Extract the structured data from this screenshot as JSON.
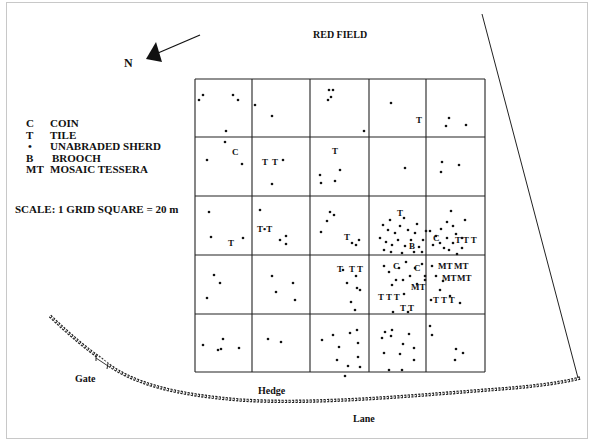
{
  "title": "RED FIELD",
  "north": {
    "label": "N"
  },
  "legend": [
    {
      "symbol": "C",
      "label": "COIN"
    },
    {
      "symbol": "•",
      "label": "TILE",
      "symbol_override": "T"
    },
    {
      "symbol": "•",
      "label": "UNABRADED SHERD"
    },
    {
      "symbol": "B",
      "label": "BROOCH"
    },
    {
      "symbol": "MT",
      "label": "MOSAIC TESSERA"
    }
  ],
  "scale": "SCALE:  1 GRID SQUARE = 20 m",
  "labels": {
    "gate": "Gate",
    "hedge": "Hedge",
    "lane": "Lane"
  },
  "grid": {
    "origin": [
      195,
      79
    ],
    "cols": [
      195,
      252,
      310,
      369,
      426,
      485
    ],
    "rows": [
      79,
      137,
      196,
      255,
      314,
      372
    ]
  },
  "sherds": [
    [
      199,
      100
    ],
    [
      203,
      95
    ],
    [
      233,
      95
    ],
    [
      238,
      100
    ],
    [
      226,
      131
    ],
    [
      255,
      105
    ],
    [
      272,
      116
    ],
    [
      329,
      90
    ],
    [
      333,
      90
    ],
    [
      331,
      97
    ],
    [
      328,
      100
    ],
    [
      364,
      131
    ],
    [
      391,
      103
    ],
    [
      449,
      118
    ],
    [
      466,
      125
    ],
    [
      446,
      126
    ],
    [
      225,
      142
    ],
    [
      207,
      160
    ],
    [
      242,
      164
    ],
    [
      283,
      160
    ],
    [
      272,
      184
    ],
    [
      320,
      175
    ],
    [
      321,
      183
    ],
    [
      340,
      170
    ],
    [
      335,
      181
    ],
    [
      405,
      168
    ],
    [
      442,
      162
    ],
    [
      459,
      165
    ],
    [
      441,
      172
    ],
    [
      209,
      212
    ],
    [
      211,
      237
    ],
    [
      243,
      238
    ],
    [
      260,
      210
    ],
    [
      280,
      240
    ],
    [
      286,
      236
    ],
    [
      286,
      244
    ],
    [
      330,
      212
    ],
    [
      334,
      215
    ],
    [
      327,
      221
    ],
    [
      321,
      232
    ],
    [
      352,
      243
    ],
    [
      356,
      245
    ],
    [
      359,
      240
    ],
    [
      214,
      275
    ],
    [
      220,
      283
    ],
    [
      207,
      298
    ],
    [
      272,
      276
    ],
    [
      276,
      292
    ],
    [
      293,
      283
    ],
    [
      295,
      300
    ],
    [
      343,
      270
    ],
    [
      347,
      283
    ],
    [
      356,
      276
    ],
    [
      357,
      288
    ],
    [
      351,
      302
    ],
    [
      360,
      290
    ],
    [
      355,
      310
    ],
    [
      203,
      345
    ],
    [
      223,
      339
    ],
    [
      221,
      349
    ],
    [
      218,
      350
    ],
    [
      239,
      348
    ],
    [
      268,
      339
    ],
    [
      281,
      342
    ],
    [
      322,
      340
    ],
    [
      333,
      335
    ],
    [
      350,
      333
    ],
    [
      357,
      330
    ],
    [
      339,
      347
    ],
    [
      358,
      343
    ],
    [
      337,
      360
    ],
    [
      348,
      366
    ],
    [
      358,
      357
    ],
    [
      345,
      376
    ],
    [
      360,
      367
    ],
    [
      385,
      332
    ],
    [
      392,
      330
    ],
    [
      382,
      338
    ],
    [
      391,
      336
    ],
    [
      409,
      334
    ],
    [
      403,
      344
    ],
    [
      414,
      348
    ],
    [
      384,
      353
    ],
    [
      400,
      354
    ],
    [
      414,
      360
    ],
    [
      389,
      370
    ],
    [
      402,
      370
    ],
    [
      430,
      326
    ],
    [
      432,
      335
    ],
    [
      456,
      349
    ],
    [
      463,
      353
    ],
    [
      455,
      360
    ]
  ],
  "cluster_sherds": [
    [
      383,
      225
    ],
    [
      390,
      220
    ],
    [
      388,
      230
    ],
    [
      395,
      233
    ],
    [
      400,
      226
    ],
    [
      404,
      218
    ],
    [
      408,
      230
    ],
    [
      398,
      240
    ],
    [
      392,
      245
    ],
    [
      386,
      242
    ],
    [
      380,
      238
    ],
    [
      405,
      246
    ],
    [
      411,
      240
    ],
    [
      415,
      233
    ],
    [
      417,
      224
    ],
    [
      419,
      247
    ],
    [
      423,
      240
    ],
    [
      426,
      231
    ],
    [
      422,
      252
    ],
    [
      414,
      252
    ],
    [
      402,
      253
    ],
    [
      391,
      252
    ],
    [
      384,
      250
    ],
    [
      430,
      231
    ],
    [
      436,
      236
    ],
    [
      433,
      245
    ],
    [
      440,
      243
    ],
    [
      444,
      248
    ],
    [
      449,
      250
    ],
    [
      453,
      243
    ],
    [
      447,
      238
    ],
    [
      441,
      229
    ],
    [
      447,
      222
    ],
    [
      453,
      226
    ],
    [
      462,
      238
    ],
    [
      456,
      234
    ],
    [
      465,
      220
    ],
    [
      451,
      211
    ],
    [
      462,
      248
    ],
    [
      457,
      254
    ],
    [
      384,
      266
    ],
    [
      389,
      272
    ],
    [
      399,
      268
    ],
    [
      406,
      262
    ],
    [
      396,
      280
    ],
    [
      403,
      280
    ],
    [
      410,
      276
    ],
    [
      415,
      268
    ],
    [
      392,
      285
    ],
    [
      404,
      294
    ],
    [
      417,
      284
    ],
    [
      422,
      264
    ],
    [
      425,
      276
    ],
    [
      432,
      266
    ],
    [
      436,
      276
    ],
    [
      443,
      281
    ],
    [
      440,
      290
    ],
    [
      450,
      296
    ],
    [
      460,
      303
    ],
    [
      431,
      300
    ],
    [
      393,
      312
    ],
    [
      408,
      312
    ],
    [
      425,
      280
    ]
  ],
  "markers": [
    {
      "text": "C",
      "x": 232,
      "y": 155
    },
    {
      "text": "T",
      "x": 262,
      "y": 165
    },
    {
      "text": "T",
      "x": 272,
      "y": 165
    },
    {
      "text": "T",
      "x": 332,
      "y": 154
    },
    {
      "text": "T",
      "x": 416,
      "y": 123
    },
    {
      "text": "T",
      "x": 228,
      "y": 246
    },
    {
      "text": "T•T",
      "x": 257,
      "y": 232
    },
    {
      "text": "T",
      "x": 344,
      "y": 240
    },
    {
      "text": "T",
      "x": 397,
      "y": 216
    },
    {
      "text": "B",
      "x": 409,
      "y": 249
    },
    {
      "text": "C",
      "x": 433,
      "y": 241
    },
    {
      "text": "T T T",
      "x": 455,
      "y": 243
    },
    {
      "text": "T",
      "x": 337,
      "y": 272
    },
    {
      "text": "T T",
      "x": 349,
      "y": 272
    },
    {
      "text": "C",
      "x": 393,
      "y": 269
    },
    {
      "text": "C",
      "x": 414,
      "y": 271
    },
    {
      "text": "MT",
      "x": 411,
      "y": 290
    },
    {
      "text": "MT",
      "x": 438,
      "y": 269
    },
    {
      "text": "MT",
      "x": 454,
      "y": 269
    },
    {
      "text": "MT",
      "x": 442,
      "y": 281
    },
    {
      "text": "MT",
      "x": 457,
      "y": 281
    },
    {
      "text": "T T T",
      "x": 378,
      "y": 300
    },
    {
      "text": "T T",
      "x": 400,
      "y": 311
    },
    {
      "text": "T T T",
      "x": 433,
      "y": 303
    }
  ]
}
